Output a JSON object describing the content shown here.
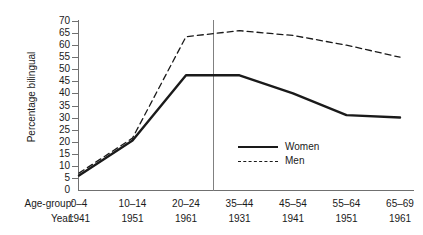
{
  "chart_data": {
    "type": "line",
    "title": "",
    "xlabel": "",
    "ylabel": "Percentage bilingual",
    "ylim": [
      0,
      70
    ],
    "yticks": [
      0,
      5,
      10,
      15,
      20,
      25,
      30,
      35,
      40,
      45,
      50,
      55,
      60,
      65,
      70
    ],
    "grid": false,
    "legend_position": "inside-lower-right",
    "categories": [
      "0–4",
      "10–14",
      "20–24",
      "35–44",
      "45–54",
      "55–64",
      "65–69"
    ],
    "x_secondary_label": "Year:",
    "x_primary_label": "Age-group:",
    "years": [
      "1941",
      "1951",
      "1961",
      "1931",
      "1941",
      "1951",
      "1961"
    ],
    "annotations": [
      {
        "type": "vertical-divider",
        "after_category_index": 2
      }
    ],
    "series": [
      {
        "name": "Women",
        "style": "solid",
        "color": "#1a1a1a",
        "values": [
          6,
          20.5,
          47.5,
          47.5,
          40,
          31,
          30
        ]
      },
      {
        "name": "Men",
        "style": "dashed",
        "color": "#1a1a1a",
        "values": [
          7,
          21.5,
          63.5,
          66,
          64,
          60,
          55
        ]
      }
    ]
  },
  "axis": {
    "y_title": "Percentage bilingual",
    "x_row1_title": "Age-group:",
    "x_row2_title": "Year:"
  },
  "legend": {
    "items": [
      {
        "label": "Women"
      },
      {
        "label": "Men"
      }
    ]
  },
  "colors": {
    "line": "#1a1a1a",
    "axis": "#707070",
    "divider": "#808080",
    "background": "#ffffff"
  }
}
